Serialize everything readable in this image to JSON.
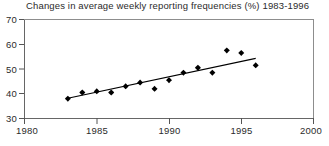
{
  "chart_data": {
    "type": "scatter",
    "title": "Changes in average weekly reporting frequencies (%) 1983-1996",
    "xlabel": "",
    "ylabel": "",
    "x": [
      1983,
      1984,
      1985,
      1986,
      1987,
      1988,
      1989,
      1990,
      1991,
      1992,
      1993,
      1994,
      1995,
      1996
    ],
    "values": [
      38.0,
      40.5,
      41.0,
      40.5,
      43.0,
      44.5,
      42.0,
      45.5,
      48.5,
      50.5,
      48.5,
      57.5,
      56.5,
      51.5
    ],
    "series": [
      {
        "name": "Average weekly reporting frequency (%)",
        "values": [
          38.0,
          40.5,
          41.0,
          40.5,
          43.0,
          44.5,
          42.0,
          45.5,
          48.5,
          50.5,
          48.5,
          57.5,
          56.5,
          51.5
        ]
      },
      {
        "name": "Linear trend line",
        "type": "line",
        "x": [
          1983,
          1996
        ],
        "values": [
          38.2,
          54.3
        ]
      }
    ],
    "xlim": [
      1980,
      2000
    ],
    "ylim": [
      30,
      70
    ],
    "xticks": [
      1980,
      1985,
      1990,
      1995,
      2000
    ],
    "xtick_labels": [
      "1980",
      "1985",
      "1990",
      "1995",
      "2000"
    ],
    "yticks": [
      30,
      40,
      50,
      60,
      70
    ],
    "ytick_labels": [
      "30",
      "40",
      "50",
      "60",
      "70"
    ],
    "grid": false,
    "legend": null,
    "marker": "filled-diamond",
    "marker_color": "#000000",
    "trendline_color": "#000000",
    "axis_color": "#555555",
    "background_color": "#ffffff"
  },
  "axes": {
    "y_tick_0": "30",
    "y_tick_1": "40",
    "y_tick_2": "50",
    "y_tick_3": "60",
    "y_tick_4": "70",
    "x_tick_0": "1980",
    "x_tick_1": "1985",
    "x_tick_2": "1990",
    "x_tick_3": "1995",
    "x_tick_4": "2000"
  }
}
